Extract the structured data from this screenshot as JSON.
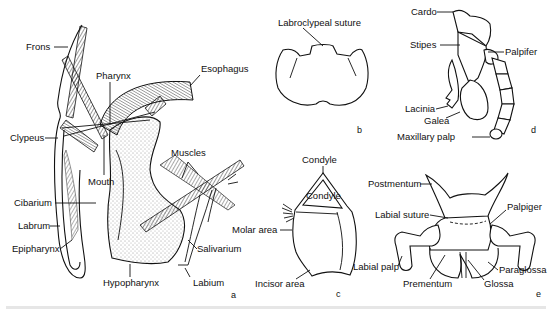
{
  "figure": {
    "panels": {
      "a": {
        "letter": "a",
        "labels": {
          "frons": "Frons",
          "pharynx": "Pharynx",
          "esophagus": "Esophagus",
          "clypeus": "Clypeus",
          "muscles": "Muscles",
          "mouth": "Mouth",
          "cibarium": "Cibarium",
          "labrum": "Labrum",
          "epipharynx": "Epipharynx",
          "salivarium": "Salivarium",
          "hypopharynx": "Hypopharynx",
          "labium": "Labium"
        }
      },
      "b": {
        "letter": "b",
        "labels": {
          "labroclypeal_suture": "Labroclypeal suture"
        }
      },
      "c": {
        "letter": "c",
        "labels": {
          "condyle_outer": "Condyle",
          "condyle_inner": "Condyle",
          "molar_area": "Molar area",
          "incisor_area": "Incisor area"
        }
      },
      "d": {
        "letter": "d",
        "labels": {
          "cardo": "Cardo",
          "stipes": "Stipes",
          "palpifer": "Palpifer",
          "lacinia": "Lacinia",
          "galea": "Galea",
          "maxillary_palp": "Maxillary palp"
        }
      },
      "e": {
        "letter": "e",
        "labels": {
          "postmentum": "Postmentum",
          "labial_suture": "Labial suture",
          "palpiger": "Palpiger",
          "labial_palp": "Labial palp",
          "prementum": "Prementum",
          "glossa": "Glossa",
          "paraglossa": "Paraglossa"
        }
      }
    }
  }
}
